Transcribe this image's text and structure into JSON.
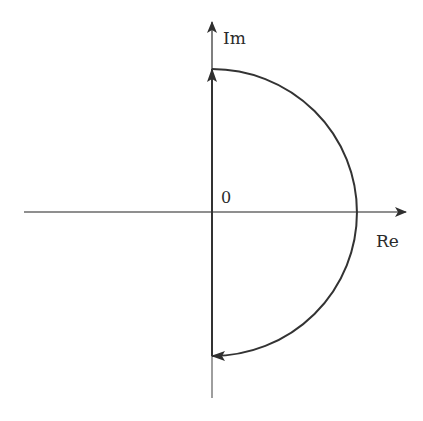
{
  "diagram": {
    "type": "nyquist-contour",
    "labels": {
      "imag_axis": "Im",
      "real_axis": "Re",
      "origin": "0"
    },
    "colors": {
      "axis": "#6a6a6a",
      "contour": "#333333",
      "text": "#2a2a2a",
      "background": "#ffffff"
    },
    "geometry": {
      "origin": [
        212,
        212
      ],
      "radius": 145,
      "real_axis_x_range": [
        24,
        408
      ],
      "imag_axis_y_range": [
        22,
        398
      ]
    }
  }
}
